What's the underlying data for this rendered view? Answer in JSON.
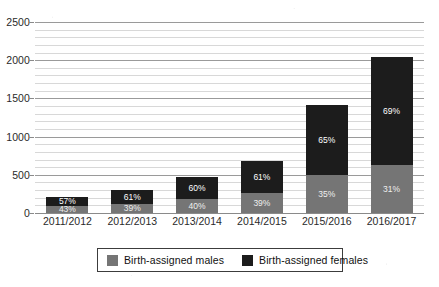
{
  "chart_data": {
    "type": "bar",
    "subtype": "stacked-bar-percent-labeled",
    "title": "",
    "xlabel": "",
    "ylabel": "",
    "ylim": [
      0,
      2500
    ],
    "ytick_step": 500,
    "minor_grid_step": 100,
    "grid": true,
    "legend_position": "bottom",
    "categories": [
      "2011/2012",
      "2012/2013",
      "2013/2014",
      "2014/2015",
      "2015/2016",
      "2016/2017"
    ],
    "ytick_labels": [
      "0",
      "500",
      "1000",
      "1500",
      "2000",
      "2500"
    ],
    "ytick_values": [
      0,
      500,
      1000,
      1500,
      2000,
      2500
    ],
    "series": [
      {
        "name": "Birth-assigned males",
        "color": "#757575",
        "values": [
          92,
          117,
          186,
          265,
          497,
          632
        ],
        "percent_labels": [
          "43%",
          "39%",
          "40%",
          "39%",
          "35%",
          "31%"
        ]
      },
      {
        "name": "Birth-assigned females",
        "color": "#1c1c1c",
        "values": [
          123,
          183,
          279,
          415,
          923,
          1408
        ],
        "percent_labels": [
          "57%",
          "61%",
          "60%",
          "61%",
          "65%",
          "69%"
        ]
      }
    ],
    "totals": [
      215,
      300,
      465,
      680,
      1420,
      2040
    ]
  },
  "legend": {
    "items": [
      {
        "label": "Birth-assigned males",
        "color": "#757575"
      },
      {
        "label": "Birth-assigned females",
        "color": "#1c1c1c"
      }
    ]
  },
  "colors": {
    "male": "#757575",
    "female": "#1c1c1c",
    "grid_minor": "#d8d8d8",
    "grid_major": "#9a9a9a",
    "text": "#2a2a2a",
    "background": "#ffffff"
  }
}
